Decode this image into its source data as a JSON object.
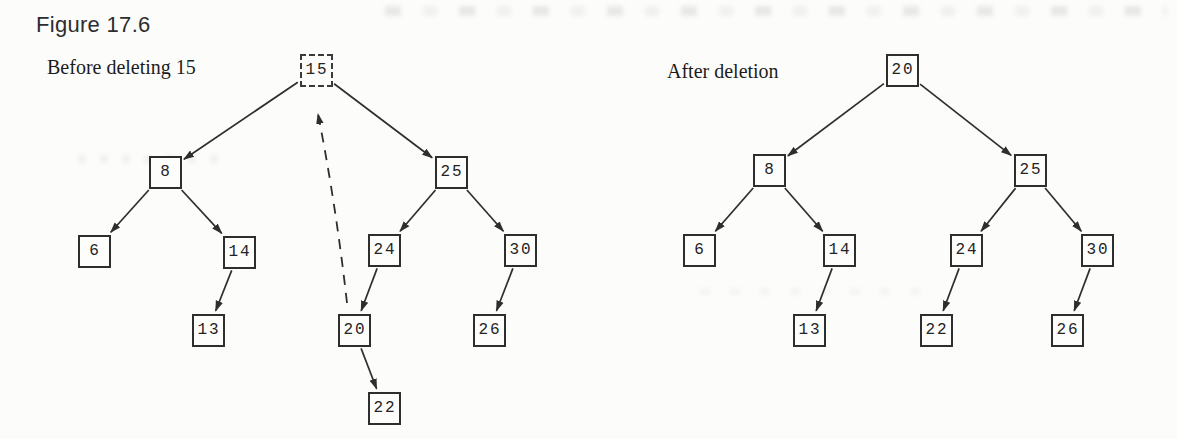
{
  "figure_title": "Figure 17.6",
  "colors": {
    "ink": "#2e2e2e",
    "paper": "#fcfcfb"
  },
  "node_box": {
    "size": 33
  },
  "trees": [
    {
      "id": "before",
      "label": "Before deleting 15",
      "label_pos": {
        "x": 47,
        "y": 56
      },
      "nodes": [
        {
          "id": "15",
          "value": "15",
          "x": 316,
          "y": 70,
          "dashed": true
        },
        {
          "id": "8",
          "value": "8",
          "x": 165,
          "y": 172
        },
        {
          "id": "25",
          "value": "25",
          "x": 451,
          "y": 172
        },
        {
          "id": "6",
          "value": "6",
          "x": 94,
          "y": 251
        },
        {
          "id": "14",
          "value": "14",
          "x": 239,
          "y": 252
        },
        {
          "id": "24",
          "value": "24",
          "x": 384,
          "y": 250
        },
        {
          "id": "30",
          "value": "30",
          "x": 520,
          "y": 250
        },
        {
          "id": "13",
          "value": "13",
          "x": 208,
          "y": 330
        },
        {
          "id": "20",
          "value": "20",
          "x": 354,
          "y": 330
        },
        {
          "id": "26",
          "value": "26",
          "x": 489,
          "y": 330
        },
        {
          "id": "22",
          "value": "22",
          "x": 384,
          "y": 408
        }
      ],
      "edges": [
        {
          "from": "15",
          "to": "8"
        },
        {
          "from": "15",
          "to": "25"
        },
        {
          "from": "8",
          "to": "6"
        },
        {
          "from": "8",
          "to": "14"
        },
        {
          "from": "14",
          "to": "13"
        },
        {
          "from": "25",
          "to": "24"
        },
        {
          "from": "25",
          "to": "30"
        },
        {
          "from": "24",
          "to": "20"
        },
        {
          "from": "20",
          "to": "22"
        },
        {
          "from": "30",
          "to": "26"
        }
      ],
      "annotations": [
        {
          "type": "dashed-arrow",
          "from": "20",
          "to": "15",
          "path": "M 347 303 Q 336 205 318 114",
          "meaning": "node 20 replaces deleted node 15"
        }
      ]
    },
    {
      "id": "after",
      "label": "After deletion",
      "label_pos": {
        "x": 667,
        "y": 60
      },
      "nodes": [
        {
          "id": "20",
          "value": "20",
          "x": 902,
          "y": 70
        },
        {
          "id": "8",
          "value": "8",
          "x": 769,
          "y": 170
        },
        {
          "id": "25",
          "value": "25",
          "x": 1030,
          "y": 170
        },
        {
          "id": "6",
          "value": "6",
          "x": 699,
          "y": 250
        },
        {
          "id": "14",
          "value": "14",
          "x": 839,
          "y": 250
        },
        {
          "id": "24",
          "value": "24",
          "x": 966,
          "y": 250
        },
        {
          "id": "30",
          "value": "30",
          "x": 1097,
          "y": 250
        },
        {
          "id": "13",
          "value": "13",
          "x": 809,
          "y": 330
        },
        {
          "id": "22",
          "value": "22",
          "x": 936,
          "y": 330
        },
        {
          "id": "26",
          "value": "26",
          "x": 1067,
          "y": 330
        }
      ],
      "edges": [
        {
          "from": "20",
          "to": "8"
        },
        {
          "from": "20",
          "to": "25"
        },
        {
          "from": "8",
          "to": "6"
        },
        {
          "from": "8",
          "to": "14"
        },
        {
          "from": "14",
          "to": "13"
        },
        {
          "from": "25",
          "to": "24"
        },
        {
          "from": "25",
          "to": "30"
        },
        {
          "from": "24",
          "to": "22"
        },
        {
          "from": "30",
          "to": "26"
        }
      ],
      "annotations": []
    }
  ]
}
